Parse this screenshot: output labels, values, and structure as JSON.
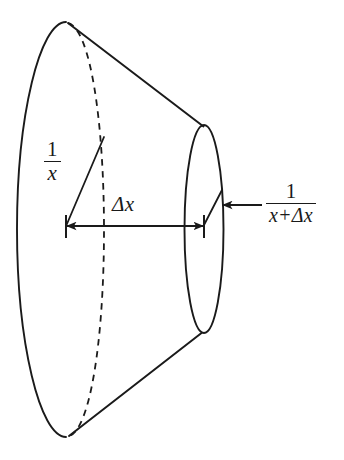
{
  "figure": {
    "name": "truncated-cone-frustum-diagram",
    "background_color": "#ffffff",
    "ink_color": "#1a1a1a",
    "width": 344,
    "height": 460
  },
  "labels": {
    "radius_left": {
      "numerator": "1",
      "denominator": "x",
      "description": "radius one over x"
    },
    "radius_right": {
      "numerator": "1",
      "denominator": "x+Δx",
      "description": "radius one over x plus delta x"
    },
    "axial_length": {
      "text": "Δx",
      "description": "axial thickness delta x"
    }
  },
  "geometry": {
    "left_ellipse": {
      "cx": 66,
      "cy": 229,
      "rx": 49,
      "ry": 207,
      "front_arc": "solid",
      "back_arc": "dashed"
    },
    "right_ellipse": {
      "cx": 204,
      "cy": 229,
      "rx": 19,
      "ry": 104,
      "stroke": "solid"
    },
    "slant_top": {
      "x1": 68,
      "y1": 23,
      "x2": 203,
      "y2": 126
    },
    "slant_bottom": {
      "x1": 69,
      "y1": 436,
      "x2": 201,
      "y2": 333
    },
    "radius_line_left": {
      "x1": 66,
      "y1": 226,
      "x2": 104,
      "y2": 137
    },
    "radius_line_right": {
      "x1": 204,
      "y1": 226,
      "x2": 222,
      "y2": 190
    },
    "dimension_line": {
      "x1": 66,
      "y1": 226,
      "x2": 204,
      "y2": 226
    },
    "leader_arrow": {
      "x1": 262,
      "y1": 205,
      "x2": 222,
      "y2": 205
    }
  }
}
